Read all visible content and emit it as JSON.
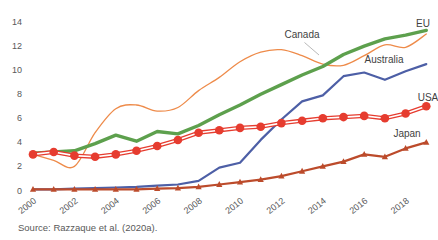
{
  "chart_data": {
    "type": "line",
    "title": "",
    "xlabel": "",
    "ylabel": "",
    "x": [
      2000,
      2001,
      2002,
      2003,
      2004,
      2005,
      2006,
      2007,
      2008,
      2009,
      2010,
      2011,
      2012,
      2013,
      2014,
      2015,
      2016,
      2017,
      2018,
      2019
    ],
    "series": [
      {
        "name": "Canada",
        "color": "#ee8b4a",
        "line_style": "thin-smooth",
        "marker": "none",
        "values": [
          3.0,
          2.5,
          2.0,
          4.8,
          6.8,
          7.1,
          6.6,
          6.9,
          8.3,
          9.4,
          10.7,
          11.5,
          11.7,
          11.2,
          10.5,
          10.4,
          11.2,
          12.1,
          11.9,
          13.0
        ]
      },
      {
        "name": "EU",
        "color": "#5da04d",
        "line_style": "thick",
        "marker": "none",
        "values": [
          3.1,
          3.2,
          3.3,
          3.9,
          4.6,
          4.1,
          4.9,
          4.7,
          5.4,
          6.3,
          7.1,
          8.0,
          8.8,
          9.6,
          10.3,
          11.3,
          12.0,
          12.6,
          12.9,
          13.3
        ]
      },
      {
        "name": "Australia",
        "color": "#4d5fa6",
        "line_style": "medium",
        "marker": "none",
        "values": [
          0.1,
          0.1,
          0.15,
          0.2,
          0.25,
          0.3,
          0.4,
          0.5,
          0.8,
          1.9,
          2.3,
          4.2,
          5.9,
          7.4,
          7.9,
          9.5,
          9.8,
          9.2,
          9.9,
          10.5
        ]
      },
      {
        "name": "USA",
        "color": "#e63c2f",
        "line_style": "double",
        "marker": "circle",
        "values": [
          3.0,
          3.2,
          2.9,
          2.8,
          3.0,
          3.3,
          3.7,
          4.2,
          4.8,
          5.0,
          5.2,
          5.3,
          5.6,
          5.8,
          6.0,
          6.1,
          6.2,
          6.0,
          6.4,
          7.0
        ]
      },
      {
        "name": "Japan",
        "color": "#bc4b2b",
        "line_style": "medium",
        "marker": "triangle",
        "values": [
          0.1,
          0.1,
          0.1,
          0.1,
          0.1,
          0.1,
          0.15,
          0.2,
          0.3,
          0.5,
          0.7,
          0.9,
          1.2,
          1.6,
          2.0,
          2.4,
          3.0,
          2.8,
          3.5,
          4.0
        ]
      }
    ],
    "ylim": [
      0,
      14
    ],
    "yticks": [
      "0",
      "2",
      "4",
      "6",
      "8",
      "10",
      "12",
      "14"
    ],
    "xtick_labels": [
      "2000",
      "2002",
      "2004",
      "2006",
      "2008",
      "2010",
      "2012",
      "2014",
      "2016",
      "2018"
    ],
    "grid": false,
    "legend": "direct-labels-on-chart"
  },
  "source_note": "Source: Razzaque et al. (2020a)."
}
